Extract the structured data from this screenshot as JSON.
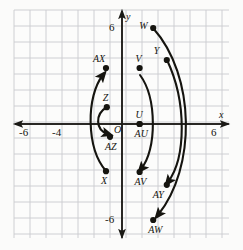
{
  "figure": {
    "kind": "coordinate-plane-diagram",
    "background_color": "#fbfbfa",
    "grid_color": "#c9cbce",
    "axis_color": "#1b1a16",
    "ink_color": "#15140f"
  },
  "axes": {
    "x_axis_label": "x",
    "y_axis_label": "y",
    "x_ticks": [
      {
        "label": "-6",
        "value": -6
      },
      {
        "label": "-4",
        "value": -4
      },
      {
        "label": "6",
        "value": 6
      }
    ],
    "y_ticks": [
      {
        "label": "6",
        "value": 6
      },
      {
        "label": "-6",
        "value": -6
      }
    ],
    "origin_label": "O",
    "x_range": [
      -6.75,
      6.7
    ],
    "y_range": [
      -7.1,
      7.1
    ],
    "grid_spacing_units": 1
  },
  "chart_data": {
    "type": "scatter",
    "title": "",
    "xlabel": "x",
    "ylabel": "y",
    "xlim": [
      -6.75,
      6.7
    ],
    "ylim": [
      -7.1,
      7.1
    ],
    "grid": true,
    "legend": "none",
    "points": [
      {
        "name": "AX",
        "label": "AX",
        "x": -1.0,
        "y": 3.5,
        "label_pos": "above-left"
      },
      {
        "name": "Z",
        "label": "Z",
        "x": -0.95,
        "y": 1.05,
        "label_pos": "above"
      },
      {
        "name": "AZ",
        "label": "AZ",
        "x": -0.75,
        "y": -0.8,
        "label_pos": "below"
      },
      {
        "name": "X",
        "label": "X",
        "x": -1.0,
        "y": -2.95,
        "label_pos": "below"
      },
      {
        "name": "V",
        "label": "V",
        "x": 1.1,
        "y": 3.5,
        "label_pos": "above"
      },
      {
        "name": "U",
        "label": "U",
        "x": 1.1,
        "y": 0.0,
        "label_pos": "above"
      },
      {
        "name": "AU",
        "label": "AU",
        "x": 1.1,
        "y": 0.0,
        "label_pos": "below"
      },
      {
        "name": "AV",
        "label": "AV",
        "x": 1.1,
        "y": -3.0,
        "label_pos": "below"
      },
      {
        "name": "W",
        "label": "W",
        "x": 1.95,
        "y": 6.0,
        "label_pos": "left"
      },
      {
        "name": "Y",
        "label": "Y",
        "x": 2.8,
        "y": 4.0,
        "label_pos": "above-left"
      },
      {
        "name": "AY",
        "label": "AY",
        "x": 2.8,
        "y": -3.8,
        "label_pos": "below-left"
      },
      {
        "name": "AW",
        "label": "AW",
        "x": 1.95,
        "y": -6.0,
        "label_pos": "below"
      }
    ],
    "arcs": [
      {
        "name": "arc-X-to-AX",
        "from": "X",
        "to": "AX",
        "bulge": "left",
        "arrow": "end"
      },
      {
        "name": "arc-Z-to-AZ",
        "from": "Z",
        "to": "AZ",
        "bulge": "left",
        "arrow": "end"
      },
      {
        "name": "arc-V-to-AV",
        "from": "V",
        "to": "AV",
        "bulge": "right",
        "arrow": "end"
      },
      {
        "name": "arc-Y-to-AY",
        "from": "Y",
        "to": "AY",
        "bulge": "right",
        "arrow": "end"
      },
      {
        "name": "arc-W-to-AW",
        "from": "W",
        "to": "AW",
        "bulge": "right",
        "arrow": "end"
      }
    ]
  }
}
